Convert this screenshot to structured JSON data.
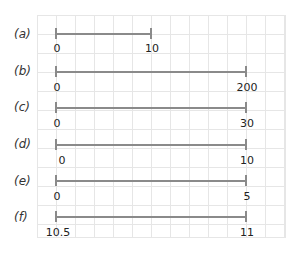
{
  "rows": [
    {
      "label": "(a)",
      "start": "0",
      "end": "10"
    },
    {
      "label": "(b)",
      "start": "0",
      "end": "200"
    },
    {
      "label": "(c)",
      "start": "0",
      "end": "30"
    },
    {
      "label": "(d)",
      "start": "0",
      "end": "10"
    },
    {
      "label": "(e)",
      "start": "0",
      "end": "5"
    },
    {
      "label": "(f)",
      "start": "10.5",
      "end": "11"
    }
  ],
  "colors": {
    "line": "#8a8a8a",
    "grid": "#e6e6e6"
  }
}
